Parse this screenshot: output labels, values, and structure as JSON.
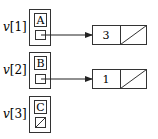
{
  "diagram": {
    "entries": [
      {
        "label": "v[1]",
        "index_var": "v",
        "index": "[1]",
        "letter": "A",
        "pointer": "set",
        "target_node": {
          "value": "3",
          "next": "null"
        }
      },
      {
        "label": "v[2]",
        "index_var": "v",
        "index": "[2]",
        "letter": "B",
        "pointer": "set",
        "target_node": {
          "value": "1",
          "next": "null"
        }
      },
      {
        "label": "v[3]",
        "index_var": "v",
        "index": "[3]",
        "letter": "C",
        "pointer": "null",
        "target_node": null
      }
    ],
    "colors": {
      "stroke": "#333333",
      "background": "#ffffff"
    }
  }
}
